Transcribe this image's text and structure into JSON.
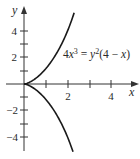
{
  "chart_data": {
    "type": "line",
    "title": "",
    "equation": "4x^3 = y^2(4 - x)",
    "equation_parts": {
      "coef": "4",
      "x": "x",
      "exp3": "3",
      "eq": " = ",
      "y": "y",
      "exp2": "2",
      "open": "(4 − ",
      "x2": "x",
      "close": ")"
    },
    "xlabel": "x",
    "ylabel": "y",
    "xlim": [
      -1,
      5.3
    ],
    "ylim": [
      -5.1,
      5.5
    ],
    "x_ticks": [
      1,
      2,
      3,
      4
    ],
    "x_tick_labels": [
      {
        "value": 2,
        "label": "2"
      },
      {
        "value": 4,
        "label": "4"
      }
    ],
    "y_ticks": [
      -4,
      -3,
      -2,
      -1,
      1,
      2,
      3,
      4
    ],
    "y_tick_labels": [
      {
        "value": 4,
        "label": "4"
      },
      {
        "value": 2,
        "label": "2"
      },
      {
        "value": -2,
        "label": "−2"
      },
      {
        "value": -4,
        "label": "−4"
      }
    ],
    "grid": false,
    "legend": null,
    "series": [
      {
        "name": "upper branch",
        "points": [
          [
            0,
            0
          ],
          [
            0.5,
            0.378
          ],
          [
            1,
            1.155
          ],
          [
            1.5,
            2.191
          ],
          [
            2,
            4
          ],
          [
            2.3,
            5.35
          ]
        ]
      },
      {
        "name": "lower branch",
        "points": [
          [
            0,
            0
          ],
          [
            0.5,
            -0.378
          ],
          [
            1,
            -1.155
          ],
          [
            1.5,
            -2.191
          ],
          [
            2,
            -4
          ],
          [
            2.25,
            -5.07
          ]
        ]
      }
    ],
    "colors": {
      "curve": "#1a1a1a",
      "axis": "#333333",
      "text": "#2a2a2a",
      "background": "#ffffff"
    }
  }
}
